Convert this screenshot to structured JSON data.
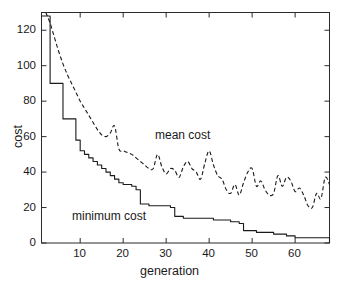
{
  "chart_data": {
    "type": "line",
    "title": "",
    "xlabel": "generation",
    "ylabel": "cost",
    "xlim": [
      1,
      68
    ],
    "ylim": [
      0,
      130
    ],
    "xticks": [
      10,
      20,
      30,
      40,
      50,
      60
    ],
    "yticks": [
      0,
      20,
      40,
      60,
      80,
      100,
      120
    ],
    "grid": false,
    "legend": "inline-annotations",
    "annotations": [
      {
        "text": "mean cost",
        "x": 36,
        "y": 58
      },
      {
        "text": "minimum cost",
        "x": 16,
        "y": 17
      }
    ],
    "series": [
      {
        "name": "mean cost",
        "style": "dashed",
        "color": "#1a1a1a",
        "x": [
          2,
          3,
          4,
          5,
          6,
          7,
          8,
          9,
          10,
          11,
          12,
          13,
          14,
          15,
          16,
          17,
          18,
          19,
          20,
          21,
          22,
          23,
          24,
          25,
          26,
          27,
          28,
          29,
          30,
          31,
          32,
          33,
          34,
          35,
          36,
          37,
          38,
          39,
          40,
          41,
          42,
          43,
          44,
          45,
          46,
          47,
          48,
          49,
          50,
          51,
          52,
          53,
          54,
          55,
          56,
          57,
          58,
          59,
          60,
          61,
          62,
          63,
          64,
          65,
          66,
          67,
          68
        ],
        "values": [
          130,
          124,
          116,
          108,
          101,
          95,
          90,
          85,
          80,
          76,
          72,
          68,
          64,
          61,
          60,
          62,
          66,
          53,
          52,
          51,
          50,
          48,
          46,
          44,
          42,
          42,
          50,
          43,
          39,
          42,
          41,
          37,
          43,
          46,
          42,
          40,
          36,
          45,
          52,
          44,
          38,
          36,
          30,
          28,
          33,
          27,
          34,
          40,
          42,
          32,
          35,
          30,
          27,
          28,
          38,
          32,
          37,
          35,
          29,
          31,
          27,
          21,
          20,
          28,
          25,
          37,
          33
        ]
      },
      {
        "name": "minimum cost",
        "style": "solid",
        "color": "#1a1a1a",
        "x": [
          1,
          2,
          3,
          4,
          5,
          6,
          7,
          8,
          9,
          10,
          11,
          12,
          13,
          14,
          15,
          16,
          17,
          18,
          19,
          20,
          21,
          22,
          23,
          24,
          25,
          26,
          27,
          28,
          29,
          30,
          31,
          32,
          33,
          34,
          35,
          36,
          37,
          38,
          39,
          40,
          41,
          42,
          43,
          44,
          45,
          46,
          47,
          48,
          49,
          50,
          51,
          52,
          53,
          54,
          55,
          56,
          57,
          58,
          59,
          60,
          61,
          62,
          63,
          64,
          65,
          66,
          67,
          68
        ],
        "values": [
          128,
          128,
          90,
          90,
          90,
          70,
          70,
          70,
          58,
          52,
          50,
          48,
          46,
          44,
          42,
          40,
          38,
          36,
          34,
          33,
          33,
          32,
          30,
          22,
          22,
          21,
          21,
          21,
          21,
          21,
          20,
          15,
          15,
          14,
          14,
          14,
          14,
          14,
          14,
          14,
          13,
          13,
          13,
          13,
          12,
          12,
          11,
          7,
          7,
          7,
          6,
          6,
          6,
          6,
          5,
          5,
          5,
          4,
          4,
          3,
          3,
          3,
          3,
          3,
          3,
          3,
          3,
          0
        ]
      }
    ]
  },
  "axes": {
    "xlabel": "generation",
    "ylabel": "cost",
    "xtick_labels": [
      "10",
      "20",
      "30",
      "40",
      "50",
      "60"
    ],
    "ytick_labels": [
      "0",
      "20",
      "40",
      "60",
      "80",
      "100",
      "120"
    ]
  },
  "annotations": {
    "mean": "mean cost",
    "minimum": "minimum cost"
  },
  "colors": {
    "line": "#1a1a1a",
    "axis": "#2b2b2b",
    "background": "#ffffff"
  }
}
